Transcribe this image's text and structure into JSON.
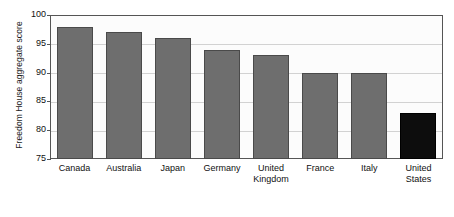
{
  "chart_data": {
    "type": "bar",
    "title": "",
    "xlabel": "",
    "ylabel": "Freedom House aggregate score",
    "ylim": [
      75,
      100
    ],
    "ytick_labels": [
      "100",
      "95",
      "90",
      "85",
      "80",
      "75"
    ],
    "ytick_values": [
      100,
      95,
      90,
      85,
      80,
      75
    ],
    "grid": true,
    "legend": "none",
    "categories": [
      "Canada",
      "Australia",
      "Japan",
      "Germany",
      "United Kingdom",
      "France",
      "Italy",
      "United States"
    ],
    "category_lines": [
      [
        "Canada"
      ],
      [
        "Australia"
      ],
      [
        "Japan"
      ],
      [
        "Germany"
      ],
      [
        "United",
        "Kingdom"
      ],
      [
        "France"
      ],
      [
        "Italy"
      ],
      [
        "United",
        "States"
      ]
    ],
    "values": [
      98,
      97,
      96,
      94,
      93,
      90,
      90,
      83
    ],
    "bar_colors": [
      "#6e6e6e",
      "#6e6e6e",
      "#6e6e6e",
      "#6e6e6e",
      "#6e6e6e",
      "#6e6e6e",
      "#6e6e6e",
      "#0d0d0d"
    ],
    "highlight_category": "United States",
    "colors": {
      "bar_default": "#6e6e6e",
      "bar_highlight": "#0d0d0d",
      "grid": "#d2d2d2",
      "frame": "#555555",
      "text": "#111111",
      "plot_background": "#fcfcfc",
      "page_background": "#ffffff"
    }
  }
}
